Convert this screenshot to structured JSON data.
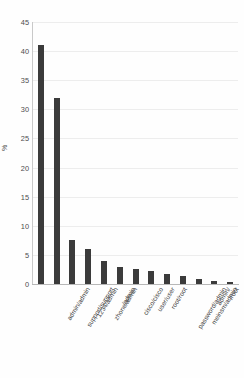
{
  "chart_data": {
    "type": "bar",
    "title": "",
    "subtitle": "",
    "xlabel": "",
    "ylabel": "%",
    "ylim": [
      0,
      45
    ],
    "ytick_labels": [
      "45",
      "40",
      "35",
      "30",
      "25",
      "20",
      "15",
      "10",
      "5",
      "0"
    ],
    "ytick_values": [
      45,
      40,
      35,
      30,
      25,
      20,
      15,
      10,
      5,
      0
    ],
    "grid": true,
    "legend": false,
    "legend_position": "none",
    "bar_color": "#3b3b3b",
    "categories": [
      "admin/admin",
      "support/support",
      "1234/admin",
      "zhone/admin",
      "/admin",
      "cisco/cisco",
      "user/user",
      "root/root",
      "password/admin",
      "meinsm/admin",
      "admin/",
      "/root",
      "pass/user"
    ],
    "values": [
      41,
      32,
      7.5,
      6,
      4,
      3,
      2.6,
      2.2,
      1.7,
      1.3,
      0.9,
      0.6,
      0.3
    ]
  }
}
